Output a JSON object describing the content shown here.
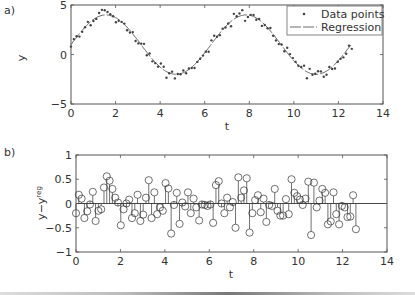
{
  "chart_data": [
    {
      "panel": "a)",
      "type": "scatter",
      "title": "",
      "xlabel": "t",
      "ylabel": "y",
      "xlim": [
        0,
        14
      ],
      "ylim": [
        -5,
        5
      ],
      "xticks": [
        "0",
        "2",
        "4",
        "6",
        "8",
        "10",
        "12",
        "14"
      ],
      "yticks": [
        "-5",
        "0",
        "5"
      ],
      "grid": false,
      "legend": {
        "position": "upper right",
        "entries": [
          "Data points",
          "Regression"
        ]
      },
      "series": [
        {
          "name": "Data points",
          "style": "dots",
          "model_hint": "y ≈ 1 + 3·sin(t) + noise",
          "t_range": [
            0,
            12.6
          ],
          "n_points": 100
        },
        {
          "name": "Regression",
          "style": "line",
          "function": "1 + 3*sin(t)",
          "t_range": [
            0,
            12.6
          ]
        }
      ]
    },
    {
      "panel": "b)",
      "type": "stem",
      "title": "",
      "xlabel": "t",
      "ylabel": "y−y^reg",
      "xlim": [
        0,
        14
      ],
      "ylim": [
        -1,
        1
      ],
      "xticks": [
        "0",
        "2",
        "4",
        "6",
        "8",
        "10",
        "12",
        "14"
      ],
      "yticks": [
        "-1",
        "-0.5",
        "0",
        "0.5",
        "1"
      ],
      "grid": false,
      "t_step": 0.126,
      "residuals": [
        -0.2,
        0.18,
        0.1,
        -0.3,
        -0.16,
        -0.02,
        0.24,
        -0.36,
        -0.15,
        -0.12,
        0.33,
        0.56,
        0.47,
        0.3,
        0.12,
        0.02,
        -0.45,
        -0.12,
        0.0,
        0.08,
        -0.3,
        -0.2,
        0.18,
        -0.36,
        -0.23,
        0.12,
        0.48,
        -0.3,
        0.23,
        -0.22,
        -0.08,
        -0.15,
        0.42,
        0.31,
        -0.62,
        -0.03,
        0.22,
        -0.42,
        0.02,
        -0.06,
        0.23,
        -0.2,
        0.1,
        -0.08,
        -0.35,
        -0.02,
        -0.03,
        -0.05,
        -0.02,
        -0.4,
        0.38,
        0.46,
        0.0,
        -0.2,
        0.12,
        -0.08,
        0.03,
        -0.5,
        0.54,
        0.12,
        0.27,
        0.52,
        -0.6,
        -0.2,
        0.07,
        0.17,
        -0.18,
        0.1,
        -0.38,
        -0.03,
        -0.05,
        0.3,
        -0.15,
        -0.25,
        -0.25,
        0.09,
        -0.22,
        0.5,
        0.22,
        0.15,
        0.08,
        -0.03,
        0.1,
        0.45,
        -0.65,
        0.43,
        -0.08,
        0.06,
        0.3,
        0.22,
        -0.43,
        -0.37,
        0.23,
        -0.22,
        -0.43,
        -0.05,
        -0.08,
        -0.28,
        -0.27,
        0.17,
        -0.53
      ]
    }
  ],
  "labels": {
    "panel_a": "a)",
    "panel_b": "b)",
    "xlabel_a": "t",
    "ylabel_a": "y",
    "xlabel_b": "t",
    "ylabel_b_main": "y−y",
    "ylabel_b_sup": "reg",
    "legend_data": "Data points",
    "legend_reg": "Regression"
  },
  "ticks": {
    "x": [
      "0",
      "2",
      "4",
      "6",
      "8",
      "10",
      "12",
      "14"
    ],
    "ya": [
      "5",
      "0",
      "−5"
    ],
    "yb": [
      "1",
      "0.5",
      "0",
      "−0.5",
      "−1"
    ]
  },
  "colors": {
    "ink": "#333333",
    "frame": "#555555",
    "background": "#ffffff"
  }
}
